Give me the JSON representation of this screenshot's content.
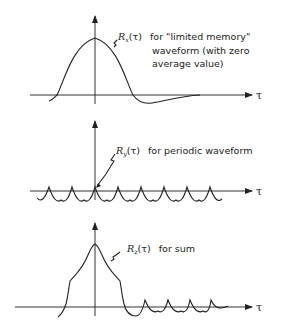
{
  "figure": {
    "panels": [
      {
        "id": "limited-memory",
        "function": "R",
        "subscript": "x",
        "argument": "(τ)",
        "label_lines": [
          "for \"limited memory\"",
          "waveform (with zero",
          "average value)"
        ],
        "axis_label": "τ"
      },
      {
        "id": "periodic",
        "function": "R",
        "subscript": "y",
        "argument": "(τ)",
        "label_lines": [
          "for periodic waveform"
        ],
        "axis_label": "τ"
      },
      {
        "id": "sum",
        "function": "R",
        "subscript": "z",
        "argument": "(τ)",
        "label_lines": [
          "for sum"
        ],
        "axis_label": "τ"
      }
    ]
  }
}
